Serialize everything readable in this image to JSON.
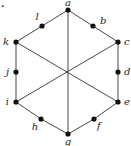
{
  "diagram": {
    "type": "graph",
    "corner_label": ".",
    "vertices": [
      {
        "id": "a",
        "label": "a",
        "x": 68,
        "y": 10,
        "lx": 68,
        "ly": 6,
        "anchor": "middle"
      },
      {
        "id": "b",
        "label": "b",
        "x": 93,
        "y": 26,
        "lx": 100,
        "ly": 24,
        "anchor": "start"
      },
      {
        "id": "c",
        "label": "c",
        "x": 118,
        "y": 42,
        "lx": 124,
        "ly": 45,
        "anchor": "start"
      },
      {
        "id": "d",
        "label": "d",
        "x": 118,
        "y": 72,
        "lx": 124,
        "ly": 75,
        "anchor": "start"
      },
      {
        "id": "e",
        "label": "e",
        "x": 118,
        "y": 102,
        "lx": 124,
        "ly": 105,
        "anchor": "start"
      },
      {
        "id": "f",
        "label": "f",
        "x": 94,
        "y": 119,
        "lx": 97,
        "ly": 129,
        "anchor": "start"
      },
      {
        "id": "g",
        "label": "g",
        "x": 68,
        "y": 134,
        "lx": 68,
        "ly": 145,
        "anchor": "middle"
      },
      {
        "id": "h",
        "label": "h",
        "x": 41,
        "y": 119,
        "lx": 35,
        "ly": 130,
        "anchor": "middle"
      },
      {
        "id": "i",
        "label": "i",
        "x": 16,
        "y": 102,
        "lx": 9,
        "ly": 105,
        "anchor": "end"
      },
      {
        "id": "j",
        "label": "j",
        "x": 16,
        "y": 72,
        "lx": 9,
        "ly": 75,
        "anchor": "end"
      },
      {
        "id": "k",
        "label": "k",
        "x": 16,
        "y": 42,
        "lx": 9,
        "ly": 45,
        "anchor": "end"
      },
      {
        "id": "l",
        "label": "l",
        "x": 42,
        "y": 26,
        "lx": 37,
        "ly": 20,
        "anchor": "middle"
      }
    ],
    "edges": [
      [
        "a",
        "b"
      ],
      [
        "b",
        "c"
      ],
      [
        "c",
        "d"
      ],
      [
        "d",
        "e"
      ],
      [
        "e",
        "f"
      ],
      [
        "f",
        "g"
      ],
      [
        "g",
        "h"
      ],
      [
        "h",
        "i"
      ],
      [
        "i",
        "j"
      ],
      [
        "j",
        "k"
      ],
      [
        "k",
        "l"
      ],
      [
        "l",
        "a"
      ],
      [
        "a",
        "g"
      ],
      [
        "k",
        "e"
      ],
      [
        "c",
        "i"
      ]
    ],
    "colors": {
      "edge": "#333333",
      "vertex": "#111111",
      "label": "#222222"
    }
  }
}
